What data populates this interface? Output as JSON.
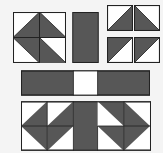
{
  "colors": {
    "background": "#f4f4f4",
    "dark": "#575757",
    "light": "#ffffff",
    "stroke": "#222222"
  },
  "pieces": {
    "pinwheel_block": {
      "label": "pinwheel block",
      "x": 13,
      "y": 12,
      "w": 52,
      "h": 50
    },
    "vertical_bar": {
      "label": "vertical dark bar",
      "x": 72,
      "y": 12,
      "w": 26,
      "h": 50
    },
    "small_squares": [
      {
        "label": "half-square triangle (dark lower-right)",
        "x": 107,
        "y": 5,
        "w": 25,
        "h": 25,
        "dark": "lower-right"
      },
      {
        "label": "half-square triangle (dark lower-left)",
        "x": 134,
        "y": 5,
        "w": 25,
        "h": 25,
        "dark": "lower-left"
      },
      {
        "label": "half-square triangle (dark upper-left)",
        "x": 107,
        "y": 37,
        "w": 25,
        "h": 25,
        "dark": "upper-left"
      },
      {
        "label": "half-square triangle (dark upper-left)",
        "x": 134,
        "y": 37,
        "w": 25,
        "h": 25,
        "dark": "upper-left"
      }
    ],
    "horizontal_bar": {
      "label": "horizontal sashing strip",
      "x": 21,
      "y": 70,
      "w": 128,
      "h": 25,
      "white_segment": {
        "x": 73,
        "w": 24
      }
    },
    "bottom_assembly": {
      "label": "assembled row",
      "x": 21,
      "y": 101,
      "w": 129,
      "h": 49
    }
  }
}
